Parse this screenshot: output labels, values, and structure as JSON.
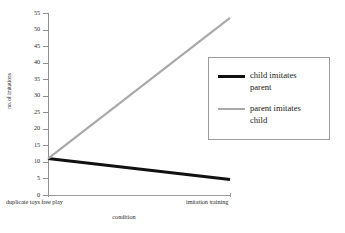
{
  "chart_data": {
    "type": "line",
    "title": "",
    "subtitle": "",
    "xlabel": "condition",
    "ylabel": "no. of imitations",
    "categories": [
      "duplicate toys free play",
      "imitation training"
    ],
    "series": [
      {
        "name": "child imitates parent",
        "values": [
          11,
          4.7
        ],
        "color": "#111111"
      },
      {
        "name": "parent imitates child",
        "values": [
          11,
          53.5
        ],
        "color": "#a9a9a9"
      }
    ],
    "ylim": [
      0,
      55
    ],
    "yticks": [
      0,
      5,
      10,
      15,
      20,
      25,
      30,
      35,
      40,
      45,
      50,
      55
    ],
    "ytick_labels": [
      "0",
      "5",
      "10",
      "15",
      "20",
      "25",
      "30",
      "35",
      "40",
      "45",
      "50",
      "55"
    ],
    "grid": false,
    "legend_position": "upper right"
  },
  "legend": {
    "entries": [
      {
        "label_line1": "child imitates",
        "label_line2": "parent",
        "swatch": "black"
      },
      {
        "label_line1": "parent imitates",
        "label_line2": "child",
        "swatch": "gray"
      }
    ]
  },
  "axes": {
    "x_title": "condition",
    "y_title": "no. of imitations",
    "x_left_label": "duplicate toys free play",
    "x_right_label": "imitation training"
  }
}
